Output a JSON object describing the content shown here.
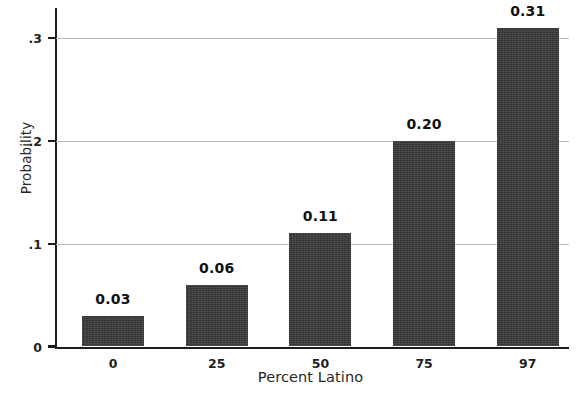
{
  "chart_data": {
    "type": "bar",
    "title": "",
    "xlabel": "Percent Latino",
    "ylabel": "Probability",
    "categories": [
      "0",
      "25",
      "50",
      "75",
      "97"
    ],
    "values": [
      0.03,
      0.06,
      0.11,
      0.2,
      0.31
    ],
    "data_labels": [
      "0.03",
      "0.06",
      "0.11",
      "0.20",
      "0.31"
    ],
    "ylim": [
      0,
      0.34
    ],
    "yticks": [
      0,
      0.1,
      0.2,
      0.3
    ],
    "ytick_labels": [
      "0",
      ".1",
      ".2",
      ".3"
    ],
    "grid": "horizontal",
    "legend": "none",
    "bar_color": "#3b3b3b",
    "gridline_color": "#b9b9b9",
    "axis_color": "#1c1c1c",
    "background_color": "#ffffff"
  }
}
